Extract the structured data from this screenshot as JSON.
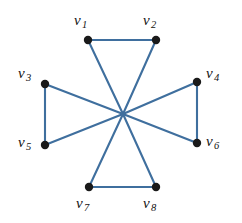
{
  "figure": {
    "kind": "graph-diagram",
    "title": "",
    "width": 242,
    "height": 223,
    "background": "#ffffff",
    "edge_color": "#3f6f9e",
    "vertex_color": "#1a1a1a",
    "label_color": "#111111"
  },
  "graph": {
    "vertices": [
      {
        "id": "v1",
        "symbol": "v",
        "index": "1",
        "cx": 88,
        "cy": 40,
        "label_x": 74,
        "label_y": 13
      },
      {
        "id": "v2",
        "symbol": "v",
        "index": "2",
        "cx": 156,
        "cy": 40,
        "label_x": 143,
        "label_y": 13
      },
      {
        "id": "v3",
        "symbol": "v",
        "index": "3",
        "cx": 45,
        "cy": 84,
        "label_x": 18,
        "label_y": 66
      },
      {
        "id": "v4",
        "symbol": "v",
        "index": "4",
        "cx": 197,
        "cy": 82,
        "label_x": 206,
        "label_y": 66
      },
      {
        "id": "v5",
        "symbol": "v",
        "index": "5",
        "cx": 45,
        "cy": 145,
        "label_x": 18,
        "label_y": 135
      },
      {
        "id": "v6",
        "symbol": "v",
        "index": "6",
        "cx": 197,
        "cy": 143,
        "label_x": 206,
        "label_y": 134
      },
      {
        "id": "v7",
        "symbol": "v",
        "index": "7",
        "cx": 89,
        "cy": 187,
        "label_x": 76,
        "label_y": 196
      },
      {
        "id": "v8",
        "symbol": "v",
        "index": "8",
        "cx": 156,
        "cy": 187,
        "label_x": 143,
        "label_y": 196
      }
    ],
    "hub": {
      "x": 123,
      "y": 114
    },
    "edges": [
      {
        "from": "v1",
        "to": "v2",
        "type": "rim"
      },
      {
        "from": "v3",
        "to": "v5",
        "type": "rim"
      },
      {
        "from": "v4",
        "to": "v6",
        "type": "rim"
      },
      {
        "from": "v7",
        "to": "v8",
        "type": "rim"
      },
      {
        "from": "v1",
        "to": "v6",
        "type": "diagonal"
      },
      {
        "from": "v2",
        "to": "v5",
        "type": "diagonal"
      },
      {
        "from": "v3",
        "to": "v8",
        "type": "diagonal"
      },
      {
        "from": "v4",
        "to": "v7",
        "type": "diagonal"
      }
    ],
    "vertex_radius": 4.2,
    "edge_width": 2.1
  }
}
